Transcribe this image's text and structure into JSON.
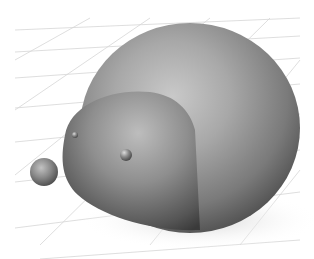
{
  "scene": {
    "description": "3D render of a smooth gray hedgehog-like figure on a perspective grid floor",
    "background_color": "#ffffff",
    "grid_color": "#d6d6d6",
    "shadow_color": "#e2e2e2",
    "body_color": "#8c8c8c",
    "objects": [
      {
        "name": "body",
        "shape": "ellipsoid"
      },
      {
        "name": "head",
        "shape": "ellipsoid"
      },
      {
        "name": "nose",
        "shape": "sphere"
      },
      {
        "name": "eye-left",
        "shape": "sphere"
      },
      {
        "name": "eye-right",
        "shape": "sphere"
      }
    ]
  }
}
